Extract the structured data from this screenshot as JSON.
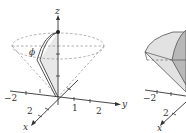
{
  "figure": {
    "left_panel": {
      "axis_labels": {
        "x": "x",
        "y": "y",
        "z": "z"
      },
      "tick_labels": {
        "neg_two": "−2",
        "x_two": "2",
        "y_one": "1",
        "y_two": "2"
      },
      "angle_label": "ϕ",
      "description": "Cone of half-angle phi with dashed surface, shaded sector"
    },
    "right_panel": {
      "axis_labels": {
        "x": "x"
      },
      "tick_labels": {
        "neg_two": "−2",
        "x_two": "2"
      },
      "description": "Solid region bounded by cone and sphere (shaded)"
    },
    "colors": {
      "axis": "#333333",
      "dashed": "#999999",
      "shade_light": "#e6e6e6",
      "shade_mid": "#c8c8c8",
      "shade_dark": "#a9a9a9"
    }
  }
}
